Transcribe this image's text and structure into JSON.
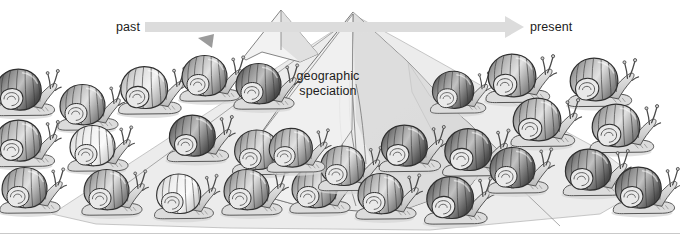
{
  "figure": {
    "background_color": "#ffffff",
    "width": 680,
    "height": 234
  },
  "timeline": {
    "past_label": "past",
    "present_label": "present",
    "arrow_color": "#dcdcdc",
    "arrow_direction": "left-to-right",
    "arrow_start_x": 145,
    "arrow_end_x": 524,
    "arrow_y": 27
  },
  "annotation": {
    "speciation_label": "geographic\nspeciation",
    "speciation_line1": "geographic",
    "speciation_line2": "speciation",
    "text_color": "#1c1c1c"
  },
  "barrier": {
    "name": "mountain-range",
    "peaks": [
      {
        "name": "minor-peak",
        "x": 281,
        "y": 10
      },
      {
        "name": "main-peak",
        "x": 353,
        "y": 12
      }
    ],
    "fill_color": "#efefef",
    "shade_color": "#d8d8d8",
    "outline_color": "#6f6f6f"
  },
  "dispersal_wedge": {
    "name": "population-spread-area",
    "fill_color": "#eaeaea",
    "outline_color": "#9a9a9a"
  },
  "chart_data": {
    "type": "diagram",
    "title": "geographic speciation",
    "xlabel": "time",
    "x_axis_ticks": [
      "past",
      "present"
    ],
    "populations": [
      {
        "name": "ancestral-and-left-lineage",
        "side": "left",
        "shell_tone": "mixed-light",
        "count": 14
      },
      {
        "name": "right-lineage",
        "side": "right",
        "shell_tone": "dark",
        "count": 14
      }
    ],
    "snails": [
      {
        "id": 1,
        "x": 26,
        "y": 92,
        "scale": 1.02,
        "tone": "dark"
      },
      {
        "id": 2,
        "x": 90,
        "y": 107,
        "scale": 1.0,
        "tone": "mid"
      },
      {
        "id": 3,
        "x": 152,
        "y": 90,
        "scale": 1.04,
        "tone": "light"
      },
      {
        "id": 4,
        "x": 212,
        "y": 78,
        "scale": 1.0,
        "tone": "mid"
      },
      {
        "id": 5,
        "x": 266,
        "y": 86,
        "scale": 1.0,
        "tone": "dark"
      },
      {
        "id": 6,
        "x": 26,
        "y": 143,
        "scale": 1.02,
        "tone": "mid"
      },
      {
        "id": 7,
        "x": 100,
        "y": 148,
        "scale": 1.0,
        "tone": "pale"
      },
      {
        "id": 8,
        "x": 200,
        "y": 138,
        "scale": 1.02,
        "tone": "dark"
      },
      {
        "id": 9,
        "x": 264,
        "y": 152,
        "scale": 0.98,
        "tone": "mid"
      },
      {
        "id": 10,
        "x": 32,
        "y": 190,
        "scale": 1.0,
        "tone": "mid"
      },
      {
        "id": 11,
        "x": 114,
        "y": 192,
        "scale": 1.0,
        "tone": "mid"
      },
      {
        "id": 12,
        "x": 186,
        "y": 196,
        "scale": 0.98,
        "tone": "pale"
      },
      {
        "id": 13,
        "x": 254,
        "y": 192,
        "scale": 1.0,
        "tone": "mid"
      },
      {
        "id": 14,
        "x": 322,
        "y": 190,
        "scale": 1.0,
        "tone": "mid"
      },
      {
        "id": 15,
        "x": 460,
        "y": 92,
        "scale": 0.92,
        "tone": "dark"
      },
      {
        "id": 16,
        "x": 520,
        "y": 78,
        "scale": 1.06,
        "tone": "mid"
      },
      {
        "id": 17,
        "x": 602,
        "y": 82,
        "scale": 1.06,
        "tone": "mid"
      },
      {
        "id": 18,
        "x": 545,
        "y": 122,
        "scale": 1.06,
        "tone": "mid"
      },
      {
        "id": 19,
        "x": 624,
        "y": 128,
        "scale": 1.06,
        "tone": "mid"
      },
      {
        "id": 20,
        "x": 350,
        "y": 168,
        "scale": 0.98,
        "tone": "mid"
      },
      {
        "id": 21,
        "x": 412,
        "y": 148,
        "scale": 1.02,
        "tone": "dark"
      },
      {
        "id": 22,
        "x": 476,
        "y": 152,
        "scale": 1.04,
        "tone": "dark"
      },
      {
        "id": 23,
        "x": 388,
        "y": 196,
        "scale": 1.0,
        "tone": "mid"
      },
      {
        "id": 24,
        "x": 458,
        "y": 200,
        "scale": 1.04,
        "tone": "dark"
      },
      {
        "id": 25,
        "x": 520,
        "y": 170,
        "scale": 1.0,
        "tone": "dark"
      },
      {
        "id": 26,
        "x": 596,
        "y": 172,
        "scale": 1.02,
        "tone": "dark"
      },
      {
        "id": 27,
        "x": 646,
        "y": 190,
        "scale": 1.02,
        "tone": "dark"
      },
      {
        "id": 28,
        "x": 298,
        "y": 150,
        "scale": 0.96,
        "tone": "mid"
      }
    ]
  }
}
